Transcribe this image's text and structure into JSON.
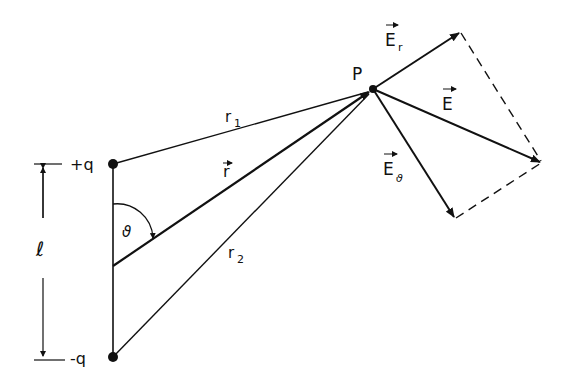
{
  "diagram": {
    "charges": {
      "positive": {
        "label": "+q"
      },
      "negative": {
        "label": "-q"
      }
    },
    "separation_label": "ℓ",
    "angle_label": "ϑ",
    "point_label": "P",
    "distances": {
      "r1": {
        "main": "r",
        "sub": "1"
      },
      "r2": {
        "main": "r",
        "sub": "2"
      },
      "r_vector": {
        "main": "r"
      }
    },
    "field_vectors": {
      "E": {
        "main": "E"
      },
      "E_r": {
        "main": "E",
        "sub": "r"
      },
      "E_theta": {
        "main": "E",
        "sub": "ϑ"
      }
    },
    "colors": {
      "ink": "#111111",
      "background": "#ffffff"
    }
  }
}
